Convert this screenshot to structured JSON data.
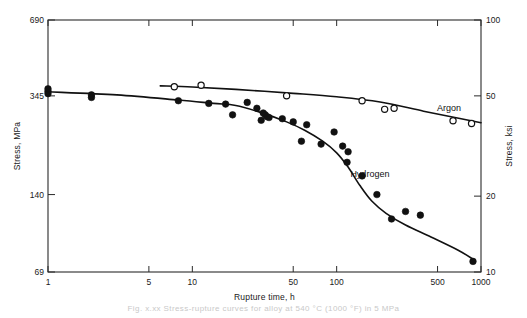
{
  "chart_data": {
    "type": "scatter",
    "title": "",
    "xlabel": "Rupture time, h",
    "ylabel": "Stress, MPa",
    "ylabel_right": "Stress, ksi",
    "xscale": "log",
    "yscale": "log",
    "xlim": [
      1,
      1000
    ],
    "ylim": [
      69,
      690
    ],
    "ylim_right": [
      10,
      100
    ],
    "grid": false,
    "legend": "inline-annotations",
    "xticks": [
      1,
      5,
      10,
      50,
      100,
      500,
      1000
    ],
    "xtick_labels": [
      "1",
      "5",
      "10",
      "50",
      "100",
      "500",
      "1000"
    ],
    "yticks": [
      69,
      140,
      345,
      690
    ],
    "ytick_labels": [
      "69",
      "140",
      "345",
      "690"
    ],
    "yticks_right": [
      10,
      20,
      50,
      100
    ],
    "ytick_labels_right": [
      "10",
      "20",
      "50",
      "100"
    ],
    "series": [
      {
        "name": "Argon",
        "marker": "open-circle",
        "label_x": 600,
        "label_y": 300,
        "points": [
          {
            "x": 7.5,
            "y": 375
          },
          {
            "x": 11.5,
            "y": 380
          },
          {
            "x": 45,
            "y": 345
          },
          {
            "x": 150,
            "y": 330
          },
          {
            "x": 215,
            "y": 305
          },
          {
            "x": 250,
            "y": 308
          },
          {
            "x": 640,
            "y": 275
          },
          {
            "x": 860,
            "y": 268
          }
        ],
        "curve": [
          {
            "x": 6,
            "y": 378
          },
          {
            "x": 10,
            "y": 374
          },
          {
            "x": 20,
            "y": 366
          },
          {
            "x": 50,
            "y": 353
          },
          {
            "x": 100,
            "y": 342
          },
          {
            "x": 200,
            "y": 326
          },
          {
            "x": 400,
            "y": 300
          },
          {
            "x": 700,
            "y": 281
          },
          {
            "x": 1000,
            "y": 270
          }
        ]
      },
      {
        "name": "Hydrogen",
        "marker": "filled-circle",
        "label_x": 170,
        "label_y": 165,
        "points": [
          {
            "x": 1,
            "y": 360
          },
          {
            "x": 1,
            "y": 352
          },
          {
            "x": 1,
            "y": 368
          },
          {
            "x": 2,
            "y": 348
          },
          {
            "x": 2,
            "y": 340
          },
          {
            "x": 8,
            "y": 330
          },
          {
            "x": 13,
            "y": 322
          },
          {
            "x": 17,
            "y": 320
          },
          {
            "x": 19,
            "y": 290
          },
          {
            "x": 24,
            "y": 325
          },
          {
            "x": 28,
            "y": 308
          },
          {
            "x": 30,
            "y": 276
          },
          {
            "x": 31,
            "y": 295
          },
          {
            "x": 32,
            "y": 290
          },
          {
            "x": 33,
            "y": 285
          },
          {
            "x": 34,
            "y": 283
          },
          {
            "x": 42,
            "y": 280
          },
          {
            "x": 50,
            "y": 272
          },
          {
            "x": 57,
            "y": 228
          },
          {
            "x": 62,
            "y": 265
          },
          {
            "x": 78,
            "y": 222
          },
          {
            "x": 96,
            "y": 248
          },
          {
            "x": 110,
            "y": 218
          },
          {
            "x": 120,
            "y": 207
          },
          {
            "x": 118,
            "y": 188
          },
          {
            "x": 150,
            "y": 166
          },
          {
            "x": 190,
            "y": 140
          },
          {
            "x": 240,
            "y": 112
          },
          {
            "x": 300,
            "y": 120
          },
          {
            "x": 380,
            "y": 116
          },
          {
            "x": 880,
            "y": 76
          }
        ],
        "curve": [
          {
            "x": 1,
            "y": 358
          },
          {
            "x": 3,
            "y": 348
          },
          {
            "x": 8,
            "y": 332
          },
          {
            "x": 14,
            "y": 322
          },
          {
            "x": 20,
            "y": 316
          },
          {
            "x": 30,
            "y": 296
          },
          {
            "x": 45,
            "y": 272
          },
          {
            "x": 60,
            "y": 252
          },
          {
            "x": 80,
            "y": 228
          },
          {
            "x": 100,
            "y": 205
          },
          {
            "x": 120,
            "y": 180
          },
          {
            "x": 145,
            "y": 152
          },
          {
            "x": 175,
            "y": 132
          },
          {
            "x": 220,
            "y": 118
          },
          {
            "x": 300,
            "y": 106
          },
          {
            "x": 450,
            "y": 95
          },
          {
            "x": 700,
            "y": 84
          },
          {
            "x": 900,
            "y": 77
          }
        ]
      }
    ]
  },
  "caption": {
    "text": "Fig. x.xx  Stress-rupture curves for alloy at 540 °C (1000 °F) in 5 MPa"
  }
}
